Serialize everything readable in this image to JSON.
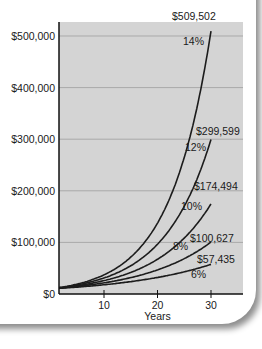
{
  "chart_data": {
    "type": "line",
    "title": "",
    "xlabel": "Years",
    "ylabel": "",
    "x_ticks": [
      10,
      20,
      30
    ],
    "y_ticks": [
      "$0",
      "$100,000",
      "$200,000",
      "$300,000",
      "$400,000",
      "$500,000"
    ],
    "y_tick_values": [
      0,
      100000,
      200000,
      300000,
      400000,
      500000
    ],
    "xlim": [
      0,
      35
    ],
    "ylim": [
      0,
      540000
    ],
    "grid": "horizontal",
    "legend": "none (inline labels)",
    "principal": 10000,
    "series": [
      {
        "name": "6%",
        "rate": 0.06,
        "end_year": 30,
        "end_value": 57435,
        "end_label": "$57,435"
      },
      {
        "name": "8%",
        "rate": 0.08,
        "end_year": 30,
        "end_value": 100627,
        "end_label": "$100,627"
      },
      {
        "name": "10%",
        "rate": 0.1,
        "end_year": 30,
        "end_value": 174494,
        "end_label": "$174,494"
      },
      {
        "name": "12%",
        "rate": 0.12,
        "end_year": 30,
        "end_value": 299599,
        "end_label": "$299,599"
      },
      {
        "name": "14%",
        "rate": 0.14,
        "end_year": 30,
        "end_value": 509502,
        "end_label": "$509,502"
      }
    ]
  },
  "colors": {
    "plot_bg": "#d4d4d4",
    "gridline": "#a9a9a9",
    "line": "#1c1c1c",
    "axis": "#111111"
  }
}
